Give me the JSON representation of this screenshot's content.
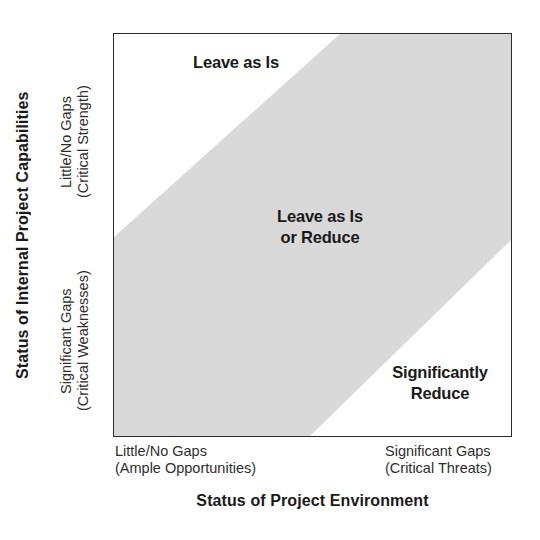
{
  "chart_data": {
    "type": "heatmap",
    "title": "",
    "xlabel": "Status of Project Environment",
    "ylabel": "Status of Internal Project Capabilities",
    "x_ticks": [
      "Little/No Gaps\n(Ample Opportunities)",
      "Significant Gaps\n(Critical Threats)"
    ],
    "y_ticks": [
      "Little/No Gaps\n(Critical Strength)",
      "Significant Gaps\n(Critical Weaknesses)"
    ],
    "grid": false,
    "legend": "none",
    "regions": [
      {
        "name": "upper-left-region",
        "label": "Leave as Is",
        "fill": "#ffffff",
        "position": "upper-left triangle"
      },
      {
        "name": "diagonal-band-region",
        "label": "Leave as Is\nor Reduce",
        "fill": "#d9d9d9",
        "position": "diagonal band from lower-left to upper-right"
      },
      {
        "name": "lower-right-region",
        "label": "Significantly\nReduce",
        "fill": "#ffffff",
        "position": "lower-right triangle"
      }
    ],
    "band_geometry": {
      "upper_edge": [
        [
          0,
          204
        ],
        [
          227,
          0
        ]
      ],
      "lower_edge": [
        [
          197,
          404
        ],
        [
          399,
          207
        ]
      ],
      "plot_width": 399,
      "plot_height": 404
    },
    "colors": {
      "band_fill": "#d9d9d9",
      "plot_background": "#ffffff",
      "border": "#2b2b2b",
      "text": "#1a1a1a",
      "tick_text": "#2e2e2e"
    }
  },
  "axes": {
    "y": {
      "title": "Status of Internal Project Capabilities",
      "tick_top": "Little/No Gaps\n(Critical Strength)",
      "tick_bottom": "Significant Gaps\n(Critical Weaknesses)"
    },
    "x": {
      "title": "Status of Project Environment",
      "tick_left": "Little/No Gaps\n(Ample Opportunities)",
      "tick_right": "Significant Gaps\n(Critical Threats)"
    }
  },
  "cells": {
    "upper_left": "Leave as Is",
    "middle_band": "Leave as Is\nor Reduce",
    "lower_right": "Significantly\nReduce"
  }
}
